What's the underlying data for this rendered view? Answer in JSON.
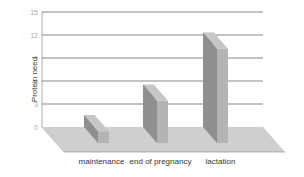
{
  "chart_data": {
    "type": "bar",
    "style": "3d",
    "title": "",
    "xlabel": "",
    "ylabel": "Protein need",
    "ylim": [
      0,
      15
    ],
    "yticks": [
      0,
      3,
      6,
      9,
      12,
      15
    ],
    "grid": true,
    "categories": [
      "maintenance",
      "end of pregnancy",
      "lactation"
    ],
    "values": [
      1.5,
      5.5,
      12.3
    ],
    "legend": null
  },
  "colors": {
    "bar_front": "#8f8f8f",
    "bar_side": "#b4b4b4",
    "bar_top": "#c6c6c6",
    "floor": "#cfcfcf",
    "grid": "#555555"
  }
}
